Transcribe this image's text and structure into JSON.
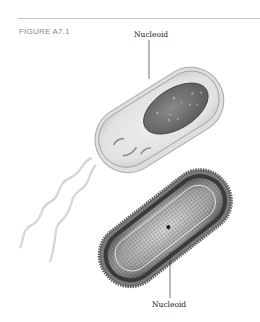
{
  "figure": {
    "label": "FIGURE A7.1",
    "callouts": [
      {
        "text": "Nucleoid",
        "target": "illustrated-cell-nucleoid"
      },
      {
        "text": "Nucleoid",
        "target": "micrograph-cell-nucleoid"
      }
    ],
    "panels": [
      {
        "type": "illustration",
        "subject": "rod-shaped bacterium with flagella"
      },
      {
        "type": "electron-micrograph",
        "subject": "rod-shaped bacterium cross-section"
      }
    ]
  }
}
